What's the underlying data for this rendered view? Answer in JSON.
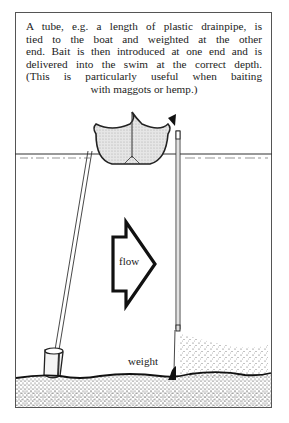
{
  "caption": {
    "lines": [
      "A tube, e.g. a length of plastic drainpipe, is",
      "tied to the boat and weighted at the other",
      "end. Bait is then introduced at one end and is",
      "delivered into the swim at the correct depth.",
      "(This is particularly useful when baiting",
      "with maggots or hemp.)"
    ]
  },
  "labels": {
    "flow": "flow",
    "weight": "weight"
  },
  "colors": {
    "ink": "#222222",
    "boat_fill": "#d8d8d8",
    "frame": "#555555"
  },
  "icons": {
    "flow_arrow": "right-arrow-icon",
    "bait_entry_marker": "triangle-pointer-icon"
  }
}
